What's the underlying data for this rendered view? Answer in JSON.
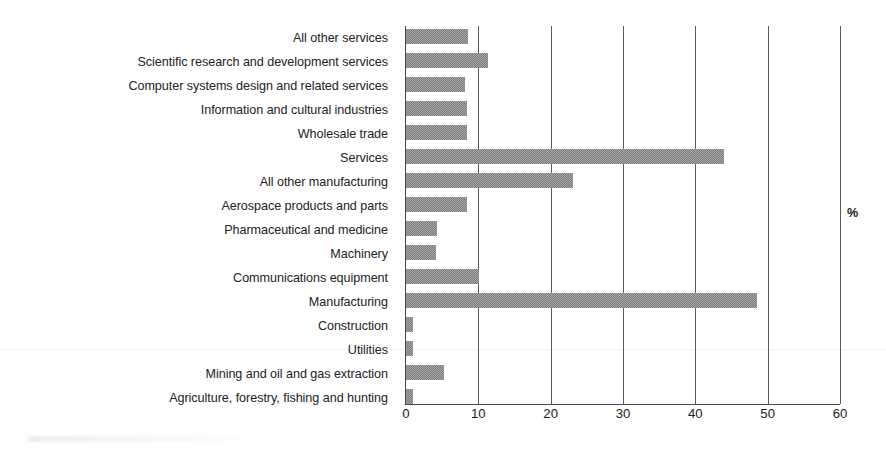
{
  "chart_data": {
    "type": "bar",
    "orientation": "horizontal",
    "title": "",
    "subtitle": "",
    "xlabel": "",
    "ylabel": "",
    "unit_label": "%",
    "xlim": [
      0,
      60
    ],
    "xticks": [
      0,
      10,
      20,
      30,
      40,
      50,
      60
    ],
    "xtick_labels": [
      "0",
      "10",
      "20",
      "30",
      "40",
      "50",
      "60"
    ],
    "grid": "vertical-major",
    "legend": null,
    "bar_color": "#7c7c7c",
    "categories": [
      "All other services",
      "Scientific research and development services",
      "Computer systems design and related services",
      "Information and cultural industries",
      "Wholesale trade",
      "Services",
      "All other manufacturing",
      "Aerospace products and parts",
      "Pharmaceutical and medicine",
      "Machinery",
      "Communications equipment",
      "Manufacturing",
      "Construction",
      "Utilities",
      "Mining and oil and gas extraction",
      "Agriculture, forestry, fishing and hunting"
    ],
    "values": [
      8.6,
      11.3,
      8.1,
      8.4,
      8.4,
      43.9,
      23.1,
      8.4,
      4.3,
      4.1,
      10.1,
      48.5,
      1.0,
      1.0,
      5.2,
      1.0
    ]
  }
}
